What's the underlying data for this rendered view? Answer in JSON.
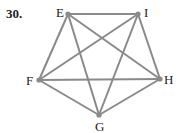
{
  "problem": {
    "number": "30."
  },
  "graph": {
    "type": "complete",
    "vertices": [
      {
        "id": "E",
        "label": "E",
        "x": 68,
        "y": 14,
        "lx": 56,
        "ly": 6
      },
      {
        "id": "I",
        "label": "I",
        "x": 138,
        "y": 14,
        "lx": 144,
        "ly": 6
      },
      {
        "id": "H",
        "label": "H",
        "x": 160,
        "y": 79,
        "lx": 164,
        "ly": 73
      },
      {
        "id": "G",
        "label": "G",
        "x": 99,
        "y": 115,
        "lx": 95,
        "ly": 120
      },
      {
        "id": "F",
        "label": "F",
        "x": 39,
        "y": 80,
        "lx": 26,
        "ly": 74
      }
    ],
    "edges": [
      [
        "E",
        "I"
      ],
      [
        "E",
        "H"
      ],
      [
        "E",
        "G"
      ],
      [
        "E",
        "F"
      ],
      [
        "I",
        "H"
      ],
      [
        "I",
        "G"
      ],
      [
        "I",
        "F"
      ],
      [
        "H",
        "G"
      ],
      [
        "H",
        "F"
      ],
      [
        "G",
        "F"
      ]
    ],
    "edge_color": "#8a8a8a",
    "vertex_color": "#8a8a8a"
  }
}
